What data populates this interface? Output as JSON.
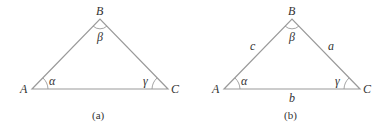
{
  "figures": [
    {
      "caption": "(a)",
      "vertices": {
        "A": "A",
        "B": "B",
        "C": "C"
      },
      "angles": {
        "alpha": "α",
        "beta": "β",
        "gamma": "γ"
      },
      "sides": null
    },
    {
      "caption": "(b)",
      "vertices": {
        "A": "A",
        "B": "B",
        "C": "C"
      },
      "angles": {
        "alpha": "α",
        "beta": "β",
        "gamma": "γ"
      },
      "sides": {
        "a": "a",
        "b": "b",
        "c": "c"
      }
    }
  ],
  "colors": {
    "edge": "#9a9a9a",
    "text": "#333333"
  }
}
